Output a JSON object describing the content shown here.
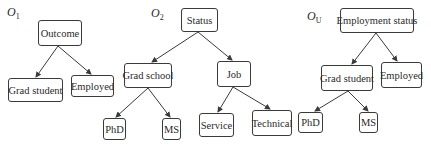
{
  "trees": [
    {
      "id": "O1",
      "label": "O",
      "label_sub": "1",
      "nodes": [
        {
          "id": "outcome",
          "label": "Outcome"
        },
        {
          "id": "grad-student",
          "label": "Grad student"
        },
        {
          "id": "employed",
          "label": "Employed"
        }
      ],
      "edges": [
        [
          "outcome",
          "grad-student"
        ],
        [
          "outcome",
          "employed"
        ]
      ]
    },
    {
      "id": "O2",
      "label": "O",
      "label_sub": "2",
      "nodes": [
        {
          "id": "status",
          "label": "Status"
        },
        {
          "id": "grad-school",
          "label": "Grad school"
        },
        {
          "id": "job",
          "label": "Job"
        },
        {
          "id": "phd",
          "label": "PhD"
        },
        {
          "id": "ms",
          "label": "MS"
        },
        {
          "id": "service",
          "label": "Service"
        },
        {
          "id": "technical",
          "label": "Technical"
        }
      ],
      "edges": [
        [
          "status",
          "grad-school"
        ],
        [
          "status",
          "job"
        ],
        [
          "grad-school",
          "phd"
        ],
        [
          "grad-school",
          "ms"
        ],
        [
          "job",
          "service"
        ],
        [
          "job",
          "technical"
        ]
      ]
    },
    {
      "id": "OU",
      "label": "O",
      "label_sub": "U",
      "nodes": [
        {
          "id": "employment-status",
          "label": "Employment status"
        },
        {
          "id": "grad-student",
          "label": "Grad student"
        },
        {
          "id": "employed",
          "label": "Employed"
        },
        {
          "id": "phd",
          "label": "PhD"
        },
        {
          "id": "ms",
          "label": "MS"
        }
      ],
      "edges": [
        [
          "employment-status",
          "grad-student"
        ],
        [
          "employment-status",
          "employed"
        ],
        [
          "grad-student",
          "phd"
        ],
        [
          "grad-student",
          "ms"
        ]
      ]
    }
  ],
  "colors": {
    "stroke": "#3a3a3a",
    "text": "#2a2a2a",
    "background": "#ffffff"
  }
}
